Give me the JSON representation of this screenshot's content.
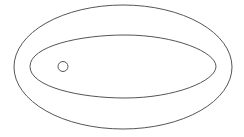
{
  "diagram": {
    "type": "nested-shapes",
    "stroke_color": "#555555",
    "background": "#ffffff",
    "shapes": [
      {
        "name": "outer-ellipse",
        "cx": 123,
        "cy": 67,
        "rx": 109,
        "ry": 62
      },
      {
        "name": "inner-ellipse",
        "cx": 123,
        "cy": 66.5,
        "rx": 93,
        "ry": 31.5
      },
      {
        "name": "small-circle",
        "cx": 63,
        "cy": 66.5,
        "r": 5
      }
    ]
  }
}
